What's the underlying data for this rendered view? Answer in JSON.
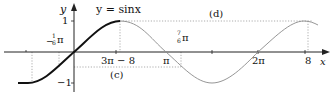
{
  "diagram": {
    "title": "y = sinx",
    "axes": {
      "x_label": "x",
      "y_label": "y"
    },
    "y_ticks": [
      {
        "label": "1"
      },
      {
        "label": "−1"
      }
    ],
    "x_labels": {
      "neg_pi_6": "−",
      "neg_pi_6_frac_num": "1",
      "neg_pi_6_frac_den": "6",
      "neg_pi_6_pi": "π",
      "three_pi_minus_8": "3π − 8",
      "seven_pi_6_num": "7",
      "seven_pi_6_den": "6",
      "seven_pi_6_pi": "π",
      "pi": "π",
      "two_pi": "2π",
      "eight": "8"
    },
    "annotations": {
      "c": "(c)",
      "d": "(d)"
    },
    "colors": {
      "bold_curve": "#111111",
      "thin_curve": "#8a8a8a",
      "axis": "#222222",
      "dotted": "#888888"
    }
  }
}
